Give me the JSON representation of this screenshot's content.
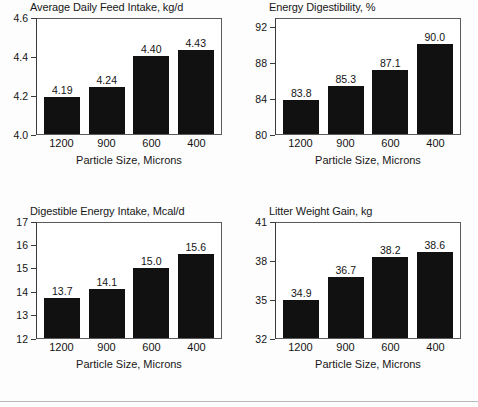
{
  "figure": {
    "title": "",
    "panel_count": 4,
    "background": "#ffffff",
    "bar_color": "#111111",
    "axis_color": "#3a3a3a"
  },
  "shared": {
    "xlabel": "Particle Size, Microns",
    "categories": [
      "1200",
      "900",
      "600",
      "400"
    ]
  },
  "chart_data": [
    {
      "type": "bar",
      "title": "Average Daily Feed Intake, kg/d",
      "xlabel": "Particle Size, Microns",
      "ylabel": "",
      "categories": [
        "1200",
        "900",
        "600",
        "400"
      ],
      "values": [
        4.19,
        4.24,
        4.4,
        4.43
      ],
      "labels": [
        "4.19",
        "4.24",
        "4.40",
        "4.43"
      ],
      "ylim": [
        4.0,
        4.6
      ],
      "yticks": [
        4.0,
        4.2,
        4.4,
        4.6
      ],
      "ytick_labels": [
        "4.0",
        "4.2",
        "4.4",
        "4.6"
      ],
      "grid": false,
      "legend": "none"
    },
    {
      "type": "bar",
      "title": "Energy Digestibility, %",
      "xlabel": "Particle Size, Microns",
      "ylabel": "",
      "categories": [
        "1200",
        "900",
        "600",
        "400"
      ],
      "values": [
        83.8,
        85.3,
        87.1,
        90.0
      ],
      "labels": [
        "83.8",
        "85.3",
        "87.1",
        "90.0"
      ],
      "ylim": [
        80,
        93
      ],
      "yticks": [
        80,
        84,
        88,
        92
      ],
      "ytick_labels": [
        "80",
        "84",
        "88",
        "92"
      ],
      "grid": false,
      "legend": "none"
    },
    {
      "type": "bar",
      "title": "Digestible Energy Intake, Mcal/d",
      "xlabel": "Particle Size, Microns",
      "ylabel": "",
      "categories": [
        "1200",
        "900",
        "600",
        "400"
      ],
      "values": [
        13.7,
        14.1,
        15.0,
        15.6
      ],
      "labels": [
        "13.7",
        "14.1",
        "15.0",
        "15.6"
      ],
      "ylim": [
        12,
        17
      ],
      "yticks": [
        12,
        13,
        14,
        15,
        16,
        17
      ],
      "ytick_labels": [
        "12",
        "13",
        "14",
        "15",
        "16",
        "17"
      ],
      "grid": false,
      "legend": "none"
    },
    {
      "type": "bar",
      "title": "Litter Weight Gain, kg",
      "xlabel": "Particle Size, Microns",
      "ylabel": "",
      "categories": [
        "1200",
        "900",
        "600",
        "400"
      ],
      "values": [
        34.9,
        36.7,
        38.2,
        38.6
      ],
      "labels": [
        "34.9",
        "36.7",
        "38.2",
        "38.6"
      ],
      "ylim": [
        32,
        41
      ],
      "yticks": [
        32,
        35,
        38,
        41
      ],
      "ytick_labels": [
        "32",
        "35",
        "38",
        "41"
      ],
      "grid": false,
      "legend": "none"
    }
  ]
}
